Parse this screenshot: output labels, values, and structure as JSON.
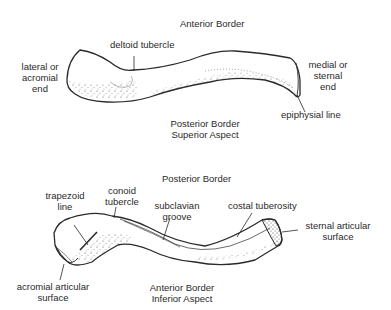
{
  "figure": {
    "superior_view": {
      "aspect_title": [
        "Posterior Border",
        "Superior Aspect"
      ],
      "top_title": "Anterior Border",
      "labels": {
        "lateral_end": [
          "lateral or",
          "acromial",
          "end"
        ],
        "deltoid_tubercle": "deltoid tubercle",
        "medial_end": [
          "medial or",
          "sternal",
          "end"
        ],
        "epiphysial_line": "epiphysial line"
      }
    },
    "inferior_view": {
      "top_title": "Posterior Border",
      "aspect_title": [
        "Anterior Border",
        "Inferior Aspect"
      ],
      "labels": {
        "trapezoid_line": [
          "trapezoid",
          "line"
        ],
        "conoid_tubercle": [
          "conoid",
          "tubercle"
        ],
        "subclavian_groove": [
          "subclavian",
          "groove"
        ],
        "costal_tuberosity": "costal tuberosity",
        "sternal_articular_surface": [
          "sternal articular",
          "surface"
        ],
        "acromial_articular_surface": [
          "acromial articular",
          "surface"
        ]
      }
    },
    "colors": {
      "ink": "#2a2a2a",
      "background": "#ffffff"
    }
  }
}
